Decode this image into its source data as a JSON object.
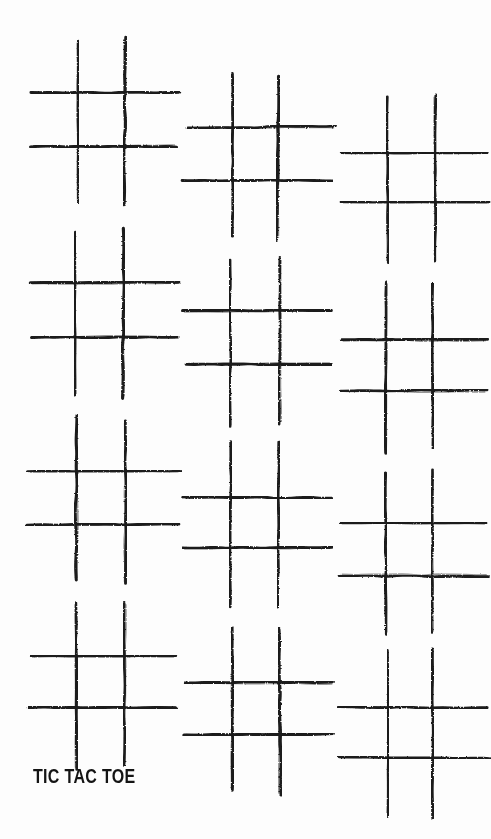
{
  "poster": {
    "width": 491,
    "height": 839,
    "background_color": "#fdfdfd",
    "ink_color": "#1a1a1a",
    "caption": "TIC TAC TOE",
    "caption_color": "#141414",
    "style": "hand-drawn marker strokes",
    "grid_count": 12,
    "columns": 3,
    "rows": 4
  },
  "boards": [
    {
      "id": "board-r1-c1",
      "row": 1,
      "col": 1,
      "x": 30,
      "y": 40,
      "width": 148,
      "height": 165
    },
    {
      "id": "board-r1-c2",
      "row": 1,
      "col": 2,
      "x": 185,
      "y": 74,
      "width": 148,
      "height": 165
    },
    {
      "id": "board-r1-c3",
      "row": 1,
      "col": 3,
      "x": 340,
      "y": 98,
      "width": 148,
      "height": 165
    },
    {
      "id": "board-r2-c1",
      "row": 2,
      "col": 1,
      "x": 30,
      "y": 230,
      "width": 148,
      "height": 165
    },
    {
      "id": "board-r2-c2",
      "row": 2,
      "col": 2,
      "x": 185,
      "y": 259,
      "width": 148,
      "height": 165
    },
    {
      "id": "board-r2-c3",
      "row": 2,
      "col": 3,
      "x": 340,
      "y": 285,
      "width": 148,
      "height": 165
    },
    {
      "id": "board-r3-c1",
      "row": 3,
      "col": 1,
      "x": 30,
      "y": 418,
      "width": 148,
      "height": 165
    },
    {
      "id": "board-r3-c2",
      "row": 3,
      "col": 2,
      "x": 185,
      "y": 443,
      "width": 148,
      "height": 165
    },
    {
      "id": "board-r3-c3",
      "row": 3,
      "col": 3,
      "x": 340,
      "y": 470,
      "width": 148,
      "height": 165
    },
    {
      "id": "board-r4-c1",
      "row": 4,
      "col": 1,
      "x": 30,
      "y": 603,
      "width": 148,
      "height": 165
    },
    {
      "id": "board-r4-c2",
      "row": 4,
      "col": 2,
      "x": 185,
      "y": 628,
      "width": 148,
      "height": 165
    },
    {
      "id": "board-r4-c3",
      "row": 4,
      "col": 3,
      "x": 340,
      "y": 652,
      "width": 148,
      "height": 165
    }
  ],
  "board_geometry": {
    "vertical_line_fractions": [
      0.315,
      0.635
    ],
    "horizontal_line_fractions": [
      0.325,
      0.64
    ],
    "stroke_width": 3.0,
    "note": "Each board is a hash (#) of 2 vertical and 2 horizontal hand-drawn strokes; no X or O marks are played on any board."
  },
  "marks": {
    "x_marks": [],
    "o_marks": [],
    "total_played": 0
  }
}
